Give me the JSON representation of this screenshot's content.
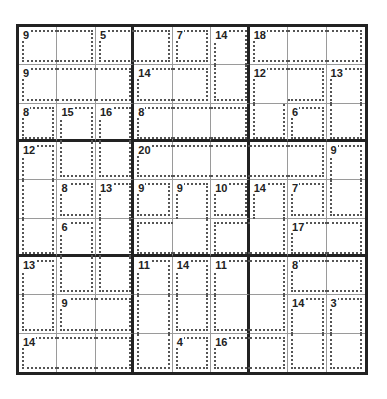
{
  "puzzle": {
    "type": "killer-sudoku",
    "size": 9,
    "colors": {
      "thick_line": "#222222",
      "thin_line": "#9a9a9a",
      "cage_line": "#555555",
      "background": "#ffffff"
    },
    "cages": [
      {
        "sum": "9",
        "cells": [
          [
            0,
            0
          ],
          [
            0,
            1
          ]
        ]
      },
      {
        "sum": "5",
        "cells": [
          [
            0,
            2
          ],
          [
            0,
            3
          ]
        ]
      },
      {
        "sum": "7",
        "cells": [
          [
            0,
            4
          ]
        ]
      },
      {
        "sum": "14",
        "cells": [
          [
            0,
            5
          ],
          [
            1,
            5
          ]
        ]
      },
      {
        "sum": "18",
        "cells": [
          [
            0,
            6
          ],
          [
            0,
            7
          ],
          [
            0,
            8
          ]
        ]
      },
      {
        "sum": "9",
        "cells": [
          [
            1,
            0
          ],
          [
            1,
            1
          ],
          [
            1,
            2
          ]
        ]
      },
      {
        "sum": "14",
        "cells": [
          [
            1,
            3
          ],
          [
            1,
            4
          ]
        ]
      },
      {
        "sum": "12",
        "cells": [
          [
            1,
            6
          ],
          [
            1,
            7
          ],
          [
            2,
            6
          ]
        ]
      },
      {
        "sum": "13",
        "cells": [
          [
            1,
            8
          ],
          [
            2,
            8
          ]
        ]
      },
      {
        "sum": "8",
        "cells": [
          [
            2,
            0
          ]
        ]
      },
      {
        "sum": "15",
        "cells": [
          [
            2,
            1
          ],
          [
            3,
            1
          ]
        ]
      },
      {
        "sum": "16",
        "cells": [
          [
            2,
            2
          ],
          [
            3,
            2
          ]
        ]
      },
      {
        "sum": "8",
        "cells": [
          [
            2,
            3
          ],
          [
            2,
            4
          ],
          [
            2,
            5
          ]
        ]
      },
      {
        "sum": "6",
        "cells": [
          [
            2,
            7
          ]
        ]
      },
      {
        "sum": "12",
        "cells": [
          [
            3,
            0
          ],
          [
            4,
            0
          ],
          [
            5,
            0
          ]
        ]
      },
      {
        "sum": "20",
        "cells": [
          [
            3,
            3
          ],
          [
            3,
            4
          ],
          [
            3,
            5
          ],
          [
            3,
            6
          ],
          [
            3,
            7
          ]
        ]
      },
      {
        "sum": "9",
        "cells": [
          [
            3,
            8
          ],
          [
            4,
            8
          ]
        ]
      },
      {
        "sum": "8",
        "cells": [
          [
            4,
            1
          ]
        ]
      },
      {
        "sum": "13",
        "cells": [
          [
            4,
            2
          ],
          [
            5,
            2
          ],
          [
            6,
            2
          ]
        ]
      },
      {
        "sum": "9",
        "cells": [
          [
            4,
            3
          ]
        ]
      },
      {
        "sum": "9",
        "cells": [
          [
            4,
            4
          ],
          [
            5,
            3
          ],
          [
            5,
            4
          ]
        ]
      },
      {
        "sum": "10",
        "cells": [
          [
            4,
            5
          ]
        ]
      },
      {
        "sum": "7",
        "cells": [
          [
            4,
            7
          ]
        ]
      },
      {
        "sum": "6",
        "cells": [
          [
            5,
            1
          ],
          [
            6,
            1
          ]
        ]
      },
      {
        "sum": "14",
        "cells": [
          [
            5,
            5
          ],
          [
            4,
            6
          ],
          [
            5,
            6
          ]
        ]
      },
      {
        "sum": "17",
        "cells": [
          [
            5,
            7
          ],
          [
            5,
            8
          ]
        ]
      },
      {
        "sum": "13",
        "cells": [
          [
            6,
            0
          ],
          [
            7,
            0
          ]
        ]
      },
      {
        "sum": "11",
        "cells": [
          [
            6,
            3
          ],
          [
            7,
            3
          ],
          [
            8,
            3
          ]
        ]
      },
      {
        "sum": "14",
        "cells": [
          [
            6,
            4
          ],
          [
            7,
            4
          ]
        ]
      },
      {
        "sum": "11",
        "cells": [
          [
            6,
            5
          ],
          [
            7,
            5
          ],
          [
            6,
            6
          ],
          [
            7,
            6
          ]
        ]
      },
      {
        "sum": "8",
        "cells": [
          [
            6,
            7
          ],
          [
            6,
            8
          ]
        ]
      },
      {
        "sum": "9",
        "cells": [
          [
            7,
            1
          ],
          [
            7,
            2
          ]
        ]
      },
      {
        "sum": "14",
        "cells": [
          [
            7,
            7
          ],
          [
            8,
            7
          ]
        ]
      },
      {
        "sum": "3",
        "cells": [
          [
            7,
            8
          ],
          [
            8,
            8
          ]
        ]
      },
      {
        "sum": "14",
        "cells": [
          [
            8,
            0
          ],
          [
            8,
            1
          ],
          [
            8,
            2
          ]
        ]
      },
      {
        "sum": "4",
        "cells": [
          [
            8,
            4
          ]
        ]
      },
      {
        "sum": "16",
        "cells": [
          [
            8,
            5
          ],
          [
            8,
            6
          ]
        ]
      }
    ]
  }
}
